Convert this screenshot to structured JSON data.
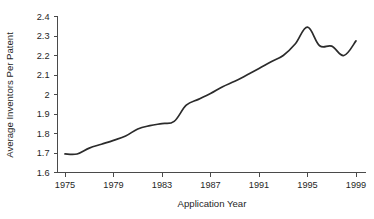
{
  "chart_data": {
    "type": "line",
    "title": "",
    "subtitle": "",
    "xlabel": "Application Year",
    "ylabel": "Average Inventors Per Patent",
    "x": [
      1975,
      1976,
      1977,
      1978,
      1979,
      1980,
      1981,
      1982,
      1983,
      1984,
      1985,
      1986,
      1987,
      1988,
      1989,
      1990,
      1991,
      1992,
      1993,
      1994,
      1995,
      1996,
      1997,
      1998,
      1999
    ],
    "values": [
      1.695,
      1.695,
      1.725,
      1.745,
      1.765,
      1.787,
      1.823,
      1.84,
      1.851,
      1.862,
      1.945,
      1.975,
      2.005,
      2.04,
      2.068,
      2.1,
      2.133,
      2.168,
      2.2,
      2.26,
      2.345,
      2.25,
      2.248,
      2.2,
      2.275
    ],
    "series": [
      {
        "name": "Average Inventors Per Patent",
        "color": "#2b2b2b",
        "values": [
          1.695,
          1.695,
          1.725,
          1.745,
          1.765,
          1.787,
          1.823,
          1.84,
          1.851,
          1.862,
          1.945,
          1.975,
          2.005,
          2.04,
          2.068,
          2.1,
          2.133,
          2.168,
          2.2,
          2.26,
          2.345,
          2.25,
          2.248,
          2.2,
          2.275
        ]
      }
    ],
    "xlim": [
      1975,
      1999
    ],
    "ylim": [
      1.6,
      2.4
    ],
    "xticks": [
      1975,
      1979,
      1983,
      1987,
      1991,
      1995,
      1999
    ],
    "xtick_labels": [
      "1975",
      "1979",
      "1983",
      "1987",
      "1991",
      "1995",
      "1999"
    ],
    "yticks": [
      1.6,
      1.7,
      1.8,
      1.9,
      2.0,
      2.1,
      2.2,
      2.3,
      2.4
    ],
    "ytick_labels": [
      "1.6",
      "1.7",
      "1.8",
      "1.9",
      "2",
      "2.1",
      "2.2",
      "2.3",
      "2.4"
    ],
    "grid": false,
    "legend": "none",
    "annotations": []
  }
}
